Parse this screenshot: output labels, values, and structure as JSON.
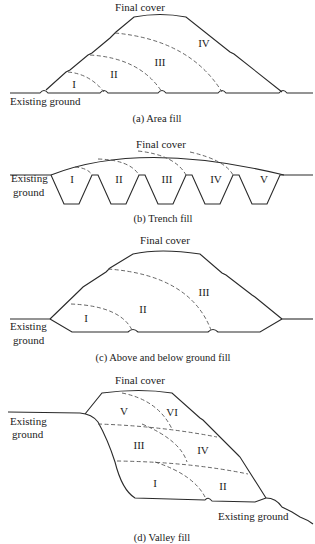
{
  "panels": [
    {
      "id": "a",
      "caption": "(a) Area fill",
      "labels": {
        "final_cover": "Final cover",
        "existing_ground": "Existing ground"
      },
      "cells": [
        "I",
        "II",
        "III",
        "IV"
      ]
    },
    {
      "id": "b",
      "caption": "(b) Trench fill",
      "labels": {
        "final_cover": "Final cover",
        "existing_ground_line1": "Existing",
        "existing_ground_line2": "ground"
      },
      "cells": [
        "I",
        "II",
        "III",
        "IV",
        "V"
      ]
    },
    {
      "id": "c",
      "caption": "(c) Above and below ground fill",
      "labels": {
        "final_cover": "Final cover",
        "existing_ground_line1": "Existing",
        "existing_ground_line2": "ground"
      },
      "cells": [
        "I",
        "II",
        "III"
      ]
    },
    {
      "id": "d",
      "caption": "(d) Valley fill",
      "labels": {
        "final_cover": "Final cover",
        "existing_ground_left_line1": "Existing",
        "existing_ground_left_line2": "ground",
        "existing_ground_right": "Existing ground"
      },
      "cells": [
        "I",
        "II",
        "III",
        "IV",
        "V",
        "VI"
      ]
    }
  ],
  "colors": {
    "line": "#2a2a2a",
    "dashed": "#555555",
    "background": "#ffffff"
  }
}
